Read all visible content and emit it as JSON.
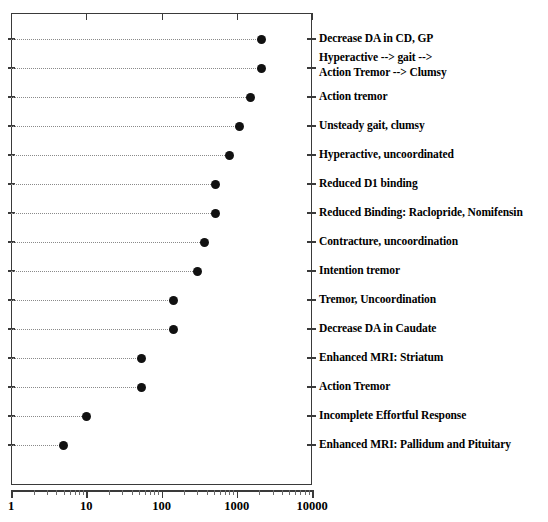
{
  "chart_data": {
    "type": "scatter",
    "title": "",
    "subtitle": "",
    "xlabel": "",
    "ylabel": "",
    "xscale": "log",
    "xlim": [
      1,
      10000
    ],
    "xticks": [
      1,
      10,
      100,
      1000,
      10000
    ],
    "xticklabels": [
      "1",
      "10",
      "100",
      "1000",
      "10000"
    ],
    "grid": "dotted-horizontal-leader-lines",
    "legend": "none",
    "marker": "filled-circle",
    "marker_color": "#111111",
    "frame_color": "#3a3a3a",
    "leader_line_color": "#8a8a8a",
    "categories": [
      "Decrease DA in CD, GP",
      "Hyperactive --> gait -->\n  Action Tremor --> Clumsy",
      "Action tremor",
      "Unsteady gait, clumsy",
      "Hyperactive, uncoordinated",
      "Reduced D1 binding",
      "Reduced Binding: Raclopride, Nomifensin",
      "Contracture, uncoordination",
      "Intention tremor",
      "Tremor, Uncoordination",
      "Decrease DA in Caudate",
      "Enhanced MRI: Striatum",
      "Action Tremor",
      "Incomplete Effortful Response",
      "Enhanced MRI: Pallidum and Pituitary"
    ],
    "values": [
      2150,
      2150,
      1500,
      1100,
      800,
      520,
      520,
      370,
      300,
      145,
      145,
      55,
      55,
      10,
      5
    ]
  },
  "axis": {
    "xticklabels": [
      "1",
      "10",
      "100",
      "1000",
      "10000"
    ]
  }
}
